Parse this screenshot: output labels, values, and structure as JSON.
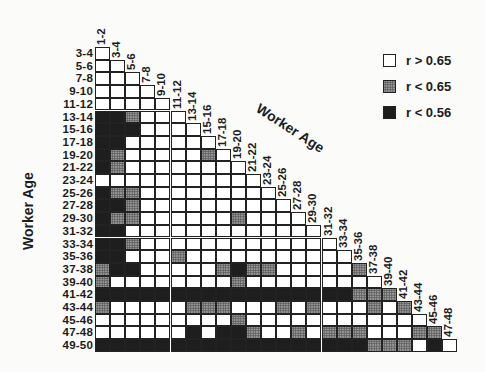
{
  "chart_data": {
    "type": "heatmap",
    "title": "",
    "xlabel": "Worker Age",
    "ylabel": "Worker Age",
    "row_labels": [
      "3-4",
      "5-6",
      "7-8",
      "9-10",
      "11-12",
      "13-14",
      "15-16",
      "17-18",
      "19-20",
      "21-22",
      "23-24",
      "25-26",
      "27-28",
      "29-30",
      "31-32",
      "33-34",
      "35-36",
      "37-38",
      "39-40",
      "41-42",
      "43-44",
      "45-46",
      "47-48",
      "49-50"
    ],
    "col_labels": [
      "1-2",
      "3-4",
      "5-6",
      "7-8",
      "9-10",
      "11-12",
      "13-14",
      "15-16",
      "17-18",
      "19-20",
      "21-22",
      "23-24",
      "25-26",
      "27-28",
      "29-30",
      "31-32",
      "33-34",
      "35-36",
      "37-38",
      "39-40",
      "41-42",
      "43-44",
      "45-46",
      "47-48"
    ],
    "legend": [
      {
        "code": "W",
        "label": "r > 0.65"
      },
      {
        "code": "G",
        "label": "r < 0.65"
      },
      {
        "code": "D",
        "label": "r < 0.56"
      }
    ],
    "matrix": [
      "W",
      "WW",
      "WWW",
      "WWWW",
      "WWWWW",
      "DDGWWW",
      "DDDWWWW",
      "DDWWWWWW",
      "DGWWWWWGW",
      "DGWWWWWWWW",
      "WWWWWWWWWWW",
      "DGGWWWWWWWWW",
      "DDGWWWWWWWWWW",
      "DGGWWWWWWGWWWW",
      "DDWWWWWWWWWWWWW",
      "DDGWWWWWWWWWWWWW",
      "DDWWWGWWWWWWWWWWW",
      "GDDWWWWWGDGGWWWWWG",
      "GWWWWWWWWGWWWWWWWWW",
      "DDDDDDDDDDDDDDDDDGGG",
      "GWWWWWGGGWWWGWGWWWGWG",
      "WWWWWWWWWGWWWWWWWWWWWW",
      "WWWWWWDWDDGWWGWGGGWWWGG",
      "DDDDDDDDDDDDDDDDDDGGGWDW"
    ],
    "layout": {
      "triangular": "lower",
      "legend_position": "top-right",
      "grid": true
    }
  }
}
